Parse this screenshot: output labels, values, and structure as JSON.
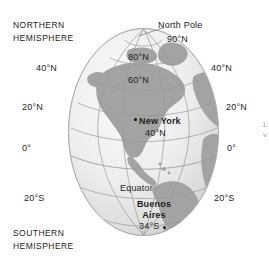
{
  "figure": {
    "type": "globe-diagram"
  },
  "colors": {
    "land": "#a3a3a3",
    "ocean_light": "#f2f2f2",
    "ocean_mid": "#e4e4e4",
    "ocean_shadow": "#c9c9c9",
    "grid_line": "#9a9a9a",
    "outline": "#b0b0b0",
    "text": "#1d1d1d",
    "background": "#ffffff"
  },
  "labels": {
    "northern_hemisphere_line1": "NORTHERN",
    "northern_hemisphere_line2": "HEMISPHERE",
    "southern_hemisphere_line1": "SOUTHERN",
    "southern_hemisphere_line2": "HEMISPHERE",
    "north_pole": "North Pole",
    "equator": "Equator"
  },
  "latitudes": {
    "pole": "90°N",
    "on_globe": [
      {
        "text": "80°N",
        "value": 80
      },
      {
        "text": "60°N",
        "value": 60
      }
    ],
    "left_side": [
      {
        "text": "40°N",
        "value": 40
      },
      {
        "text": "20°N",
        "value": 20
      },
      {
        "text": "0°",
        "value": 0
      },
      {
        "text": "20°S",
        "value": -20
      }
    ],
    "right_side": [
      {
        "text": "40°N",
        "value": 40
      },
      {
        "text": "20°N",
        "value": 20
      },
      {
        "text": "0°",
        "value": 0
      },
      {
        "text": "20°S",
        "value": -20
      }
    ]
  },
  "cities": [
    {
      "name": "New York",
      "name_line1": "New York",
      "latitude_text": "40°N",
      "latitude_value": 40,
      "marker": "city-dot"
    },
    {
      "name": "Buenos Aires",
      "name_line1": "Buenos",
      "name_line2": "Aires",
      "latitude_text": "34°S",
      "latitude_value": -34,
      "marker": "city-dot"
    }
  ],
  "edge_fragment": {
    "line1": "1:",
    "line2": "v"
  }
}
